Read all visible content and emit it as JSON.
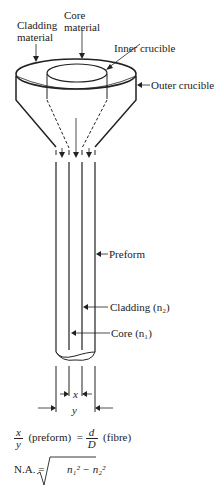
{
  "labels": {
    "cladding_material": [
      "Cladding",
      "material"
    ],
    "core_material": [
      "Core",
      "material"
    ],
    "inner_crucible": "Inner crucible",
    "outer_crucible": "Outer crucible",
    "preform": "Preform",
    "cladding": "Cladding (n₂)",
    "core": "Core (n₁)",
    "dim_x": "x",
    "dim_y": "y"
  },
  "equations": {
    "ratio": {
      "lhs_num": "x",
      "lhs_den": "y",
      "lhs_note": "(preform)",
      "equals": "=",
      "rhs_num": "d",
      "rhs_den": "D",
      "rhs_note": "(fibre)"
    },
    "na": {
      "lhs": "N.A. =",
      "radicand": "n₁² − n₂²"
    }
  }
}
